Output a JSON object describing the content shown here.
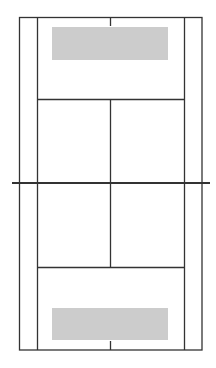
{
  "diagram": {
    "type": "tennis-court",
    "orientation": "vertical",
    "colors": {
      "background": "#ffffff",
      "line": "#333333",
      "zone": "#cccccc"
    },
    "court": {
      "outer_left": 19,
      "inner_left": 37,
      "center_x": 110,
      "inner_right": 184,
      "outer_right": 202,
      "top_baseline": 17,
      "top_service_line": 99,
      "net": 183,
      "bottom_service_line": 267,
      "bottom_baseline": 350,
      "net_left": 12,
      "net_right": 210
    },
    "zones": [
      {
        "name": "top-target-zone",
        "x": 52,
        "y": 27,
        "w": 116,
        "h": 33
      },
      {
        "name": "bottom-target-zone",
        "x": 52,
        "y": 308,
        "w": 116,
        "h": 32
      }
    ]
  }
}
